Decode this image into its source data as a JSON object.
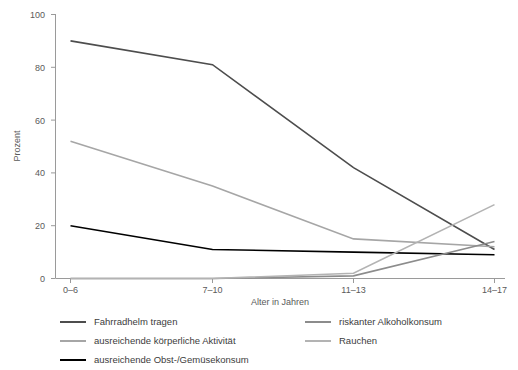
{
  "chart_data": {
    "type": "line",
    "title": "",
    "xlabel": "Alter in Jahren",
    "ylabel": "Prozent",
    "categories": [
      "0–6",
      "7–10",
      "11–13",
      "14–17"
    ],
    "ylim": [
      0,
      100
    ],
    "yticks": [
      0,
      20,
      40,
      60,
      80,
      100
    ],
    "grid": false,
    "legend_position": "bottom",
    "series": [
      {
        "name": "Fahrradhelm tragen",
        "color": "#4d4d4d",
        "values": [
          90,
          81,
          42,
          11
        ]
      },
      {
        "name": "ausreichende körperliche Aktivität",
        "color": "#a6a6a6",
        "values": [
          52,
          35,
          15,
          12
        ]
      },
      {
        "name": "ausreichende Obst-/Gemüsekonsum",
        "color": "#000000",
        "values": [
          20,
          11,
          10,
          9
        ]
      },
      {
        "name": "riskanter Alkoholkonsum",
        "color": "#8c8c8c",
        "values": [
          0,
          0,
          1,
          14
        ]
      },
      {
        "name": "Rauchen",
        "color": "#b3b3b3",
        "values": [
          0,
          0,
          2,
          28
        ]
      }
    ]
  },
  "axis": {
    "y_tick_labels": [
      "0",
      "20",
      "40",
      "60",
      "80",
      "100"
    ],
    "x_tick_labels": [
      "0–6",
      "7–10",
      "11–13",
      "14–17"
    ],
    "y_title": "Prozent",
    "x_title": "Alter in Jahren"
  },
  "legend": {
    "rows": [
      {
        "left": {
          "label": "Fahrradhelm tragen",
          "color": "#4d4d4d"
        },
        "right": {
          "label": "riskanter Alkoholkonsum",
          "color": "#8c8c8c"
        }
      },
      {
        "left": {
          "label": "ausreichende körperliche Aktivität",
          "color": "#a6a6a6"
        },
        "right": {
          "label": "Rauchen",
          "color": "#b3b3b3"
        }
      },
      {
        "left": {
          "label": "ausreichende Obst-/Gemüsekonsum",
          "color": "#000000"
        },
        "right": null
      }
    ]
  }
}
